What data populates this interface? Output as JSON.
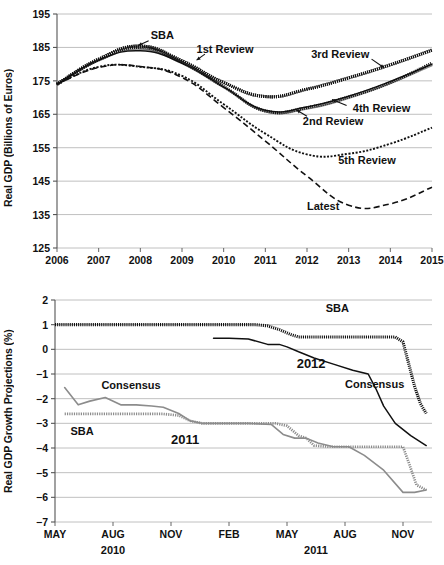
{
  "chart_data": [
    {
      "id": "real-gdp-levels",
      "type": "line",
      "title": "",
      "xlabel": "",
      "ylabel": "Real GDP (Billions of Euros)",
      "xlim": [
        2006,
        2015
      ],
      "ylim": [
        125,
        195
      ],
      "yticks": [
        125,
        135,
        145,
        155,
        165,
        175,
        185,
        195
      ],
      "xticks": [
        2006,
        2007,
        2008,
        2009,
        2010,
        2011,
        2012,
        2013,
        2014,
        2015
      ],
      "grid": true,
      "legend": "inline-annotations",
      "x": [
        2006,
        2007,
        2008,
        2009,
        2010,
        2011,
        2012,
        2013,
        2014,
        2015
      ],
      "series": [
        {
          "name": "SBA",
          "style": "thick-dotted-black",
          "values": [
            174.0,
            181.5,
            185.4,
            181.0,
            174.5,
            170.3,
            172.5,
            175.9,
            179.8,
            184.2
          ]
        },
        {
          "name": "1st Review",
          "style": "thick-dotted-black",
          "values": [
            174.0,
            181.3,
            185.0,
            180.5,
            173.3,
            166.0,
            167.0,
            170.2,
            174.5,
            180.3
          ]
        },
        {
          "name": "3rd Review",
          "style": "thick-dotted-black",
          "values": [
            174.0,
            181.5,
            185.4,
            181.0,
            174.5,
            170.3,
            172.5,
            175.9,
            179.8,
            184.2
          ]
        },
        {
          "name": "2nd Review",
          "style": "solid-gray",
          "values": [
            174.0,
            181.0,
            184.5,
            180.2,
            173.0,
            165.8,
            166.6,
            169.8,
            174.2,
            179.6
          ]
        },
        {
          "name": "4th Review",
          "style": "solid-black",
          "values": [
            174.0,
            181.2,
            184.0,
            180.3,
            173.2,
            166.2,
            167.2,
            170.4,
            174.8,
            180.0
          ]
        },
        {
          "name": "5th Review",
          "style": "fine-dotted-black",
          "values": [
            174.0,
            179.2,
            179.2,
            176.5,
            168.0,
            159.2,
            153.0,
            153.2,
            156.2,
            161.0
          ]
        },
        {
          "name": "Latest",
          "style": "dashed-black",
          "values": [
            174.0,
            179.0,
            179.3,
            176.0,
            167.0,
            157.0,
            146.5,
            137.8,
            138.2,
            143.2
          ]
        }
      ],
      "annotations": [
        {
          "text": "SBA",
          "x": 2008.25,
          "y": 188.5
        },
        {
          "text": "1st Review",
          "x": 2009.35,
          "y": 184.2
        },
        {
          "text": "3rd Review",
          "x": 2012.1,
          "y": 182.7
        },
        {
          "text": "4th Review",
          "x": 2013.1,
          "y": 166.5
        },
        {
          "text": "2nd Review",
          "x": 2011.9,
          "y": 162.8
        },
        {
          "text": "5th Review",
          "x": 2012.75,
          "y": 151.0
        },
        {
          "text": "Latest",
          "x": 2012.0,
          "y": 137.3
        }
      ]
    },
    {
      "id": "real-gdp-growth-projections",
      "type": "line",
      "title": "",
      "xlabel": "",
      "ylabel": "Real GDP Growth Projections (%)",
      "ylim": [
        -7,
        2
      ],
      "yticks": [
        2,
        1,
        0,
        -1,
        -2,
        -3,
        -4,
        -5,
        -6,
        -7
      ],
      "xticks": [
        "MAY",
        "AUG",
        "NOV",
        "FEB",
        "MAY",
        "AUG",
        "NOV"
      ],
      "xtick_positions": [
        0,
        3,
        6,
        9,
        12,
        15,
        18
      ],
      "xgroups": [
        {
          "label": "2010",
          "position": 3
        },
        {
          "label": "2011",
          "position": 13.5
        }
      ],
      "xlim": [
        0,
        19.5
      ],
      "grid": true,
      "series": [
        {
          "name": "SBA (2012)",
          "style": "thick-dotted-black",
          "x": [
            0,
            2,
            4,
            6,
            8,
            9.6,
            10.4,
            11.0,
            11.6,
            12.2,
            12.6,
            13.2,
            14,
            15,
            16,
            17,
            17.6,
            18.0,
            18.3,
            18.6,
            18.9,
            19.2
          ],
          "values": [
            1.0,
            1.0,
            1.0,
            1.0,
            1.0,
            1.0,
            1.0,
            0.95,
            0.8,
            0.6,
            0.5,
            0.5,
            0.5,
            0.5,
            0.5,
            0.5,
            0.5,
            0.3,
            -0.6,
            -1.5,
            -2.2,
            -2.6
          ]
        },
        {
          "name": "Consensus (2012)",
          "style": "solid-black",
          "x": [
            8.2,
            9.0,
            10.0,
            11.0,
            11.6,
            12.0,
            12.6,
            13.4,
            14.4,
            15.4,
            16.2,
            16.6,
            17.0,
            17.6,
            18.4,
            19.2
          ],
          "values": [
            0.45,
            0.45,
            0.42,
            0.2,
            0.2,
            0.1,
            -0.1,
            -0.35,
            -0.6,
            -0.85,
            -1.0,
            -1.6,
            -2.3,
            -3.0,
            -3.5,
            -3.9
          ]
        },
        {
          "name": "SBA (2011)",
          "style": "dotted-gray",
          "x": [
            0.5,
            2,
            4,
            5.6,
            6.4,
            7.0,
            7.6,
            8.4,
            10,
            11.4,
            12.0,
            12.6,
            13.0,
            13.4,
            14.2,
            15.2,
            16.4,
            17.4,
            18.0,
            18.3,
            18.7,
            19.2
          ],
          "values": [
            -2.62,
            -2.62,
            -2.62,
            -2.62,
            -2.68,
            -2.9,
            -3.0,
            -3.0,
            -3.0,
            -3.0,
            -3.1,
            -3.5,
            -3.6,
            -3.9,
            -3.95,
            -3.95,
            -3.95,
            -3.95,
            -3.95,
            -4.6,
            -5.5,
            -5.7
          ]
        },
        {
          "name": "Consensus (2011)",
          "style": "solid-gray",
          "x": [
            0.5,
            1.2,
            1.8,
            2.6,
            3.4,
            4.2,
            5.0,
            5.6,
            6.4,
            7.0,
            7.6,
            8.6,
            10,
            11.2,
            11.8,
            12.4,
            13.0,
            13.6,
            14.4,
            15.2,
            16.0,
            17.0,
            18.0,
            18.6,
            19.2
          ],
          "values": [
            -1.55,
            -2.25,
            -2.1,
            -1.95,
            -2.25,
            -2.25,
            -2.3,
            -2.35,
            -2.6,
            -2.9,
            -3.0,
            -3.0,
            -3.0,
            -3.05,
            -3.45,
            -3.6,
            -3.6,
            -3.8,
            -3.95,
            -3.95,
            -4.3,
            -4.9,
            -5.8,
            -5.8,
            -5.7
          ]
        }
      ],
      "annotations": [
        {
          "text": "SBA",
          "x": 14.0,
          "y": 1.62
        },
        {
          "text": "2012",
          "x": 12.5,
          "y": -0.55
        },
        {
          "text": "Consensus",
          "x": 15.0,
          "y": -1.45
        },
        {
          "text": "Consensus",
          "x": 2.4,
          "y": -1.5
        },
        {
          "text": "SBA",
          "x": 0.8,
          "y": -3.35
        },
        {
          "text": "2011",
          "x": 6.0,
          "y": -3.65
        }
      ]
    }
  ],
  "colors": {
    "black": "#111111",
    "gray": "#8c8c8c",
    "gridline": "#b9b9b9",
    "axis": "#555555",
    "background": "#ffffff"
  },
  "panel_top": {
    "ylabel": "Real GDP (Billions of Euros)",
    "yticks": [
      "195",
      "185",
      "175",
      "165",
      "155",
      "145",
      "135",
      "125"
    ],
    "xticks": [
      "2006",
      "2007",
      "2008",
      "2009",
      "2010",
      "2011",
      "2012",
      "2013",
      "2014",
      "2015"
    ],
    "labels": {
      "sba": "SBA",
      "first_review": "1st Review",
      "third_review": "3rd Review",
      "fourth_review": "4th Review",
      "second_review": "2nd Review",
      "fifth_review": "5th Review",
      "latest": "Latest"
    }
  },
  "panel_bottom": {
    "ylabel": "Real GDP Growth Projections (%)",
    "yticks": [
      "2",
      "1",
      "0",
      "−1",
      "−2",
      "−3",
      "−4",
      "−5",
      "−6",
      "−7"
    ],
    "xticks": [
      "MAY",
      "AUG",
      "NOV",
      "FEB",
      "MAY",
      "AUG",
      "NOV"
    ],
    "xgroups": [
      "2010",
      "2011"
    ],
    "labels": {
      "sba_2012": "SBA",
      "year_2012": "2012",
      "consensus_2012": "Consensus",
      "consensus_2011": "Consensus",
      "sba_2011": "SBA",
      "year_2011": "2011"
    }
  }
}
